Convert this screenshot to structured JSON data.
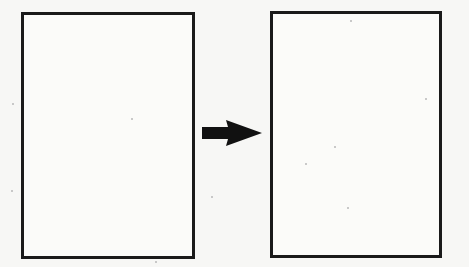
{
  "diagram": {
    "type": "transition",
    "nodes": [
      {
        "id": "left",
        "label": "",
        "content": ""
      },
      {
        "id": "right",
        "label": "",
        "content": ""
      }
    ],
    "edges": [
      {
        "from": "left",
        "to": "right",
        "style": "solid-black-arrow",
        "label": ""
      }
    ],
    "colors": {
      "stroke": "#1a1a1a",
      "background": "#f7f7f5"
    }
  }
}
